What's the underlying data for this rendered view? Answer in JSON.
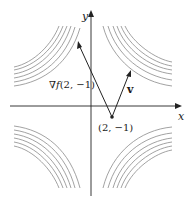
{
  "diagram": {
    "type": "level-curves-with-gradient",
    "axes": {
      "x_label": "x",
      "y_label": "y"
    },
    "point": {
      "label": "(2, −1)"
    },
    "gradient_vector": {
      "label_prefix": "∇",
      "label_func": "f",
      "label_args": "(2, −1)"
    },
    "direction_vector": {
      "label": "v"
    },
    "colors": {
      "curves": "#8a8a8a",
      "axes": "#222222",
      "vectors": "#222222"
    }
  }
}
